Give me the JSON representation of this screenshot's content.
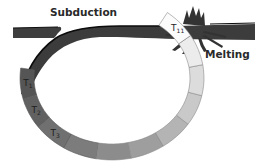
{
  "diagram": {
    "labels": {
      "subduction": "Subduction",
      "melting": "Melting"
    },
    "segments": [
      {
        "id": "T1",
        "label": "T",
        "sub": "1",
        "fill": "#555555"
      },
      {
        "id": "T2",
        "label": "T",
        "sub": "2",
        "fill": "#616161"
      },
      {
        "id": "T3",
        "label": "T",
        "sub": "3",
        "fill": "#707070"
      },
      {
        "id": "T4",
        "label": "",
        "sub": "",
        "fill": "#7c7c7c"
      },
      {
        "id": "T5",
        "label": "",
        "sub": "",
        "fill": "#8c8c8c"
      },
      {
        "id": "T6",
        "label": "",
        "sub": "",
        "fill": "#9e9e9e"
      },
      {
        "id": "T7",
        "label": "",
        "sub": "",
        "fill": "#b4b4b4"
      },
      {
        "id": "T8",
        "label": "",
        "sub": "",
        "fill": "#c9c9c9"
      },
      {
        "id": "T9",
        "label": "",
        "sub": "",
        "fill": "#dcdcdc"
      },
      {
        "id": "T10",
        "label": "",
        "sub": "",
        "fill": "#ececec"
      },
      {
        "id": "T11",
        "label": "T",
        "sub": "11",
        "fill": "#fbfbfb"
      }
    ],
    "colors": {
      "plate": "#3c3c3c",
      "edge": "#111111",
      "segment_stroke": "#8a8a8a"
    }
  }
}
